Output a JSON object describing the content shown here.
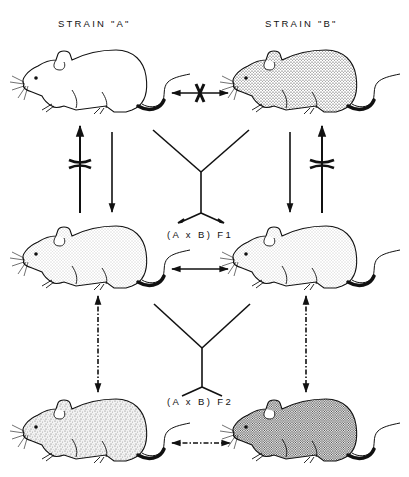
{
  "labels": {
    "strain_a": "STRAIN \"A\"",
    "strain_b": "STRAIN \"B\"",
    "f1": "(A x B) F1",
    "f2": "(A x B) F2"
  },
  "mice": [
    {
      "id": "strain-a",
      "row": 1,
      "col": "left",
      "fill": "#ffffff",
      "pattern": "none"
    },
    {
      "id": "strain-b",
      "row": 1,
      "col": "right",
      "fill": "#d8d8d8",
      "pattern": "dots-medium"
    },
    {
      "id": "f1-left",
      "row": 2,
      "col": "left",
      "fill": "#eeeeee",
      "pattern": "dots-light"
    },
    {
      "id": "f1-right",
      "row": 2,
      "col": "right",
      "fill": "#eeeeee",
      "pattern": "dots-light"
    },
    {
      "id": "f2-left",
      "row": 3,
      "col": "left",
      "fill": "#e4e4e4",
      "pattern": "mottled"
    },
    {
      "id": "f2-right",
      "row": 3,
      "col": "right",
      "fill": "#b8b8b8",
      "pattern": "dots-dense"
    }
  ],
  "arrows": [
    {
      "id": "a-b-blocked",
      "type": "double-headed",
      "blocked": true
    },
    {
      "id": "a-to-f1-up-blocked",
      "type": "up",
      "blocked": true
    },
    {
      "id": "a-to-f1-down",
      "type": "down",
      "blocked": false
    },
    {
      "id": "b-to-f1-down",
      "type": "down",
      "blocked": false
    },
    {
      "id": "b-to-f1-up-blocked",
      "type": "up",
      "blocked": true
    },
    {
      "id": "f1-f1",
      "type": "double-headed",
      "blocked": false
    },
    {
      "id": "f1-f2-left",
      "type": "double-headed-dashdot",
      "blocked": false
    },
    {
      "id": "f1-f2-right",
      "type": "double-headed-dashdot",
      "blocked": false
    },
    {
      "id": "f2-f2",
      "type": "double-headed-dashdot",
      "blocked": false
    }
  ],
  "colors": {
    "ink": "#111111",
    "background": "#ffffff"
  }
}
